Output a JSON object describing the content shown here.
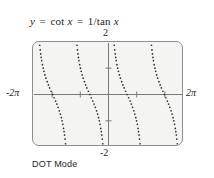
{
  "figure": {
    "equation": {
      "lhs": "y",
      "eq1": "=",
      "mid": "cot x",
      "eq2": "=",
      "rhs": "1/tan x",
      "full": "y = cot x = 1/tan x"
    },
    "caption": "DOT Mode",
    "colors": {
      "screen_background": "#f4f4f2",
      "screen_border": "#8d8d8d",
      "axis": "#777777",
      "dot": "#2b2b2b",
      "text": "#1c1c1c"
    }
  },
  "chart_data": {
    "type": "scatter",
    "title": "y = cot x = 1/tan x",
    "annotations": [
      "DOT Mode"
    ],
    "xlabel": "",
    "ylabel": "",
    "xlim": [
      -6.283185307,
      6.283185307
    ],
    "ylim": [
      -2,
      2
    ],
    "xlim_label": [
      "-2π",
      "2π"
    ],
    "ylim_label": [
      "-2",
      "2"
    ],
    "grid": false,
    "legend": "none",
    "axis_ticks": {
      "x_tick_values": [
        -4.71238898,
        -1.570796327,
        1.570796327,
        4.71238898
      ],
      "x_tick_labels": [
        "",
        "",
        "",
        ""
      ],
      "y_tick_values": [
        -1,
        1
      ],
      "y_tick_labels": [
        "",
        ""
      ]
    },
    "function": "cot(x)",
    "render_mode": "dot",
    "asymptotes_x": [
      -6.283185307,
      -3.141592654,
      0,
      3.141592654,
      6.283185307
    ],
    "branch_count": 4,
    "branches": [
      {
        "domain": [
          -6.283185307,
          -3.141592654
        ],
        "label": "branch-1"
      },
      {
        "domain": [
          -3.141592654,
          0
        ],
        "label": "branch-2"
      },
      {
        "domain": [
          0,
          3.141592654
        ],
        "label": "branch-3"
      },
      {
        "domain": [
          3.141592654,
          6.283185307
        ],
        "label": "branch-4"
      }
    ],
    "series": [
      {
        "name": "cot x",
        "style": "dotted",
        "values": []
      }
    ]
  }
}
